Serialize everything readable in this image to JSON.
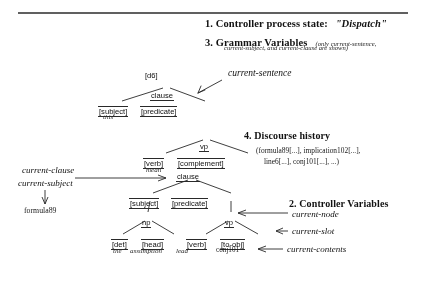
{
  "figure": {
    "title_block": {
      "item1_label": "1. Controller process state:",
      "item1_value": "\"Dispatch\"",
      "item3_label": "3. Grammar Variables",
      "item3_note_line1": "(only current-sentence,",
      "item3_note_line2": "current-subject, and current-clause are shown)"
    },
    "discourse": {
      "heading": "4. Discourse history",
      "line1": "(formula89[...], implication102[...],",
      "line2": "line6[...], conj101[...], ...)"
    },
    "controller_vars": {
      "heading": "2. Controller Variables",
      "items": [
        "current-node",
        "current-slot",
        "current-contents"
      ]
    },
    "grammar_vars": {
      "current_sentence": "current-sentence",
      "current_clause": "current-clause",
      "current_subject": "current-subject",
      "formula_ref": "formula89",
      "discourse_id": "[d6]"
    },
    "tree": {
      "nodes": [
        {
          "id": "clause-top",
          "label": "clause",
          "kind": "underline"
        },
        {
          "id": "subject-1",
          "label": "[subject]",
          "kind": "box"
        },
        {
          "id": "predicate-1",
          "label": "[predicate]",
          "kind": "box"
        },
        {
          "id": "vp-1",
          "label": "vp",
          "kind": "underline"
        },
        {
          "id": "verb-1",
          "label": "[verb]",
          "kind": "box"
        },
        {
          "id": "complement-1",
          "label": "[complement]",
          "kind": "box"
        },
        {
          "id": "clause-2",
          "label": "clause",
          "kind": "underline"
        },
        {
          "id": "subject-2",
          "label": "[subject]",
          "kind": "box"
        },
        {
          "id": "predicate-2",
          "label": "[predicate]",
          "kind": "box"
        },
        {
          "id": "np-1",
          "label": "np",
          "kind": "underline"
        },
        {
          "id": "vp-2",
          "label": "vp",
          "kind": "underline"
        },
        {
          "id": "det-1",
          "label": "[det]",
          "kind": "box"
        },
        {
          "id": "head-1",
          "label": "[head]",
          "kind": "box"
        },
        {
          "id": "verb-2",
          "label": "[verb]",
          "kind": "box"
        },
        {
          "id": "toobj-1",
          "label": "[to-obj]",
          "kind": "box"
        }
      ],
      "terminals": [
        {
          "id": "t-this",
          "label": "this"
        },
        {
          "id": "t-mean",
          "label": "mean"
        },
        {
          "id": "t-the",
          "label": "the"
        },
        {
          "id": "t-assumption",
          "label": "assumption"
        },
        {
          "id": "t-lead",
          "label": "lead"
        },
        {
          "id": "t-conj101",
          "label": "conj101"
        }
      ]
    }
  }
}
